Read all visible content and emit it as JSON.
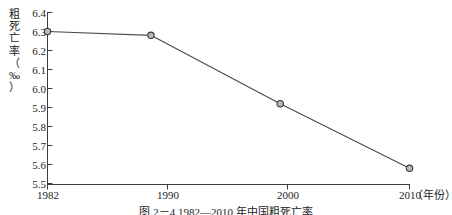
{
  "chart_data": {
    "type": "line",
    "title": "",
    "xlabel": "（年份）",
    "ylabel": "粗死亡率（‰）",
    "x": [
      1982,
      1990,
      2000,
      2010
    ],
    "categories": [
      "1982",
      "1990",
      "2000",
      "2010"
    ],
    "values": [
      6.3,
      6.28,
      5.92,
      5.58
    ],
    "series": [
      {
        "name": "粗死亡率",
        "values": [
          6.3,
          6.28,
          5.92,
          5.58
        ]
      }
    ],
    "xlim": [
      1982,
      2010
    ],
    "ylim": [
      5.5,
      6.4
    ],
    "yticks": [
      "6.4",
      "6.3",
      "6.2",
      "6.1",
      "6.0",
      "5.9",
      "5.8",
      "5.7",
      "5.6",
      "5.5"
    ],
    "ytick_values": [
      6.4,
      6.3,
      6.2,
      6.1,
      6.0,
      5.9,
      5.8,
      5.7,
      5.6,
      5.5
    ],
    "xticks": [
      "1982",
      "1990",
      "2000",
      "2010"
    ],
    "grid": false,
    "legend": "none",
    "marker": "open-circle",
    "line_color": "#4c4c4c",
    "marker_fill": "#b8b8b8",
    "marker_stroke": "#3a3a3a"
  },
  "y_axis_title_chars": [
    "粗",
    "死",
    "亡",
    "率",
    "（",
    "‰",
    "）"
  ],
  "caption": "图 2－4 1982—2010 年中国粗死亡率"
}
